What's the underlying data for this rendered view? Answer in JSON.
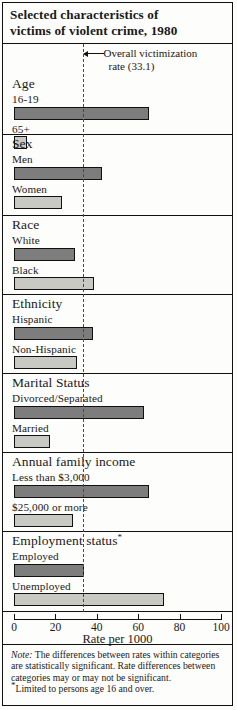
{
  "title": {
    "line1": "Selected characteristics of",
    "line2": "victims of violent crime, 1980"
  },
  "reference": {
    "label_line1": "Overall victimization",
    "label_line2": "rate (33.1)",
    "value": 33.1
  },
  "axis": {
    "title": "Rate per 1000",
    "ticks": [
      "0",
      "20",
      "40",
      "60",
      "80",
      "100"
    ],
    "min": 0,
    "max": 100
  },
  "note": {
    "prefix": "Note:",
    "body": " The differences between rates within categories are statistically significant. Rate differences between categories may or may not be significant.",
    "footnote_marker": "*",
    "footnote": "Limited to persons age 16 and over."
  },
  "chart_data": {
    "type": "bar",
    "orientation": "horizontal",
    "title": "Selected characteristics of victims of violent crime, 1980",
    "xlabel": "Rate per 1000",
    "ylabel": "",
    "xlim": [
      0,
      100
    ],
    "xticks": [
      0,
      20,
      40,
      60,
      80,
      100
    ],
    "grid": false,
    "legend": "none",
    "reference_line": {
      "label": "Overall victimization rate (33.1)",
      "value": 33.1
    },
    "groups": [
      {
        "name": "Age",
        "bars": [
          {
            "label": "16-19",
            "value": 65.0,
            "shade": "dark"
          },
          {
            "label": "65+",
            "value": 6.3,
            "shade": "light"
          }
        ]
      },
      {
        "name": "Sex",
        "bars": [
          {
            "label": "Men",
            "value": 42.5,
            "shade": "dark"
          },
          {
            "label": "Women",
            "value": 23.0,
            "shade": "light"
          }
        ]
      },
      {
        "name": "Race",
        "bars": [
          {
            "label": "White",
            "value": 29.5,
            "shade": "dark"
          },
          {
            "label": "Black",
            "value": 38.5,
            "shade": "light"
          }
        ]
      },
      {
        "name": "Ethnicity",
        "bars": [
          {
            "label": "Hispanic",
            "value": 38.0,
            "shade": "dark"
          },
          {
            "label": "Non-Hispanic",
            "value": 30.5,
            "shade": "light"
          }
        ]
      },
      {
        "name": "Marital Status",
        "bars": [
          {
            "label": "Divorced/Separated",
            "value": 63.0,
            "shade": "dark"
          },
          {
            "label": "Married",
            "value": 17.5,
            "shade": "light"
          }
        ]
      },
      {
        "name": "Annual family income",
        "bars": [
          {
            "label": "Less than $3,000",
            "value": 65.0,
            "shade": "dark"
          },
          {
            "label": "$25,000 or more",
            "value": 28.5,
            "shade": "light"
          }
        ]
      },
      {
        "name": "Employment status",
        "name_suffix": "*",
        "bars": [
          {
            "label": "Employed",
            "value": 34.0,
            "shade": "dark"
          },
          {
            "label": "Unemployed",
            "value": 72.5,
            "shade": "light"
          }
        ]
      }
    ]
  }
}
